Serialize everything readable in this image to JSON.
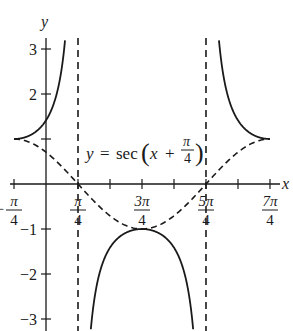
{
  "chart_data": {
    "type": "line",
    "title": "",
    "equation_label": {
      "lhs": "y",
      "eq": "=",
      "func": "sec",
      "var": "x",
      "plus": "+",
      "frac_num": "π",
      "frac_den": "4"
    },
    "xlabel": "x",
    "ylabel": "y",
    "x_range_radians": [
      -0.7854,
      5.4978
    ],
    "ylim": [
      -3.3,
      3.2
    ],
    "grid": false,
    "legend": null,
    "x_ticks": [
      {
        "value": -0.7854,
        "num": "π",
        "den": "4",
        "sign": "−",
        "labeled": true
      },
      {
        "value": 0.7854,
        "num": "π",
        "den": "4",
        "sign": "",
        "labeled": true
      },
      {
        "value": 1.5708,
        "labeled": false
      },
      {
        "value": 2.3562,
        "num": "3π",
        "den": "4",
        "sign": "",
        "labeled": true
      },
      {
        "value": 3.1416,
        "labeled": false
      },
      {
        "value": 3.927,
        "num": "5π",
        "den": "4",
        "sign": "",
        "labeled": true
      },
      {
        "value": 4.7124,
        "labeled": false
      },
      {
        "value": 5.4978,
        "num": "7π",
        "den": "4",
        "sign": "",
        "labeled": true
      }
    ],
    "y_ticks": [
      {
        "value": 3,
        "label": "3"
      },
      {
        "value": 2,
        "label": "2"
      },
      {
        "value": -1,
        "label": "−1"
      },
      {
        "value": -2,
        "label": "−2"
      },
      {
        "value": -3,
        "label": "−3"
      },
      {
        "value": 1,
        "label": ""
      }
    ],
    "asymptotes": [
      0.7854,
      3.927
    ],
    "series": [
      {
        "name": "y = sec(x + π/4)",
        "style": "solid",
        "function": "sec(x+pi/4)",
        "branches": [
          {
            "x_from": -0.7854,
            "x_to": 0.7854
          },
          {
            "x_from": 0.7854,
            "x_to": 3.927
          },
          {
            "x_from": 3.927,
            "x_to": 5.4978
          }
        ],
        "key_points": [
          {
            "x": -0.7854,
            "y": 1
          },
          {
            "x": 2.3562,
            "y": -1
          },
          {
            "x": 5.4978,
            "y": 1
          }
        ]
      },
      {
        "name": "y = cos(x + π/4)",
        "style": "dashed",
        "function": "cos(x+pi/4)",
        "x_from": -0.7854,
        "x_to": 5.4978,
        "key_points": [
          {
            "x": -0.7854,
            "y": 1
          },
          {
            "x": 0.7854,
            "y": 0
          },
          {
            "x": 2.3562,
            "y": -1
          },
          {
            "x": 3.927,
            "y": 0
          },
          {
            "x": 5.4978,
            "y": 1
          }
        ]
      }
    ],
    "layout": {
      "origin_px": [
        46,
        184
      ],
      "px_per_radian": 40.74,
      "px_per_unit_y": 45,
      "x_axis_px": [
        10,
        280
      ],
      "y_axis_px": [
        38,
        331
      ]
    },
    "colors": {
      "ink": "#1a1a1a",
      "background": "#ffffff"
    }
  }
}
